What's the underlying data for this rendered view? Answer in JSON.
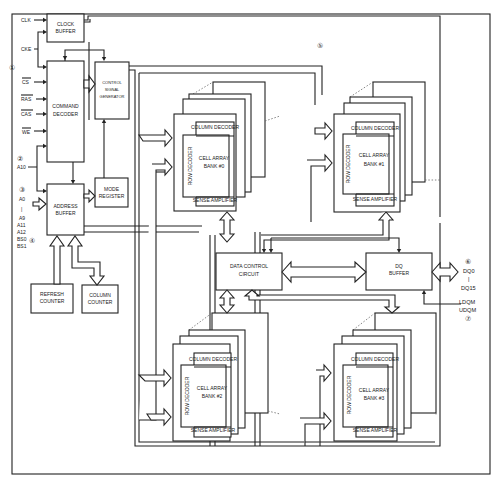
{
  "diagram": {
    "type": "block-diagram",
    "inputs": {
      "clk": "CLK",
      "cke": "CKE",
      "cs": "CS",
      "ras": "RAS",
      "cas": "CAS",
      "we": "WE",
      "a10": "A10",
      "a0": "A0",
      "sep": "|",
      "a9": "A9",
      "a11": "A11",
      "a12": "A12",
      "bs0": "BS0",
      "bs1": "BS1"
    },
    "callouts": {
      "c1": "①",
      "c2": "②",
      "c3": "③",
      "c4": "④",
      "c5": "⑤",
      "c6": "⑥",
      "c7": "⑦"
    },
    "blocks": {
      "clock_buffer": [
        "CLOCK",
        "BUFFER"
      ],
      "command_decoder": [
        "COMMAND",
        "DECODER"
      ],
      "control_signal_generator": [
        "CONTROL",
        "SIGNAL",
        "GENERATOR"
      ],
      "mode_register": [
        "MODE",
        "REGISTER"
      ],
      "address_buffer": [
        "ADDRESS",
        "BUFFER"
      ],
      "refresh_counter": [
        "REFRESH",
        "COUNTER"
      ],
      "column_counter": [
        "COLUMN",
        "COUNTER"
      ],
      "data_control_circuit": [
        "DATA CONTROL",
        "CIRCUIT"
      ],
      "dq_buffer": [
        "DQ",
        "BUFFER"
      ]
    },
    "banks": [
      {
        "column_decoder": "COLUMN DECODER",
        "row_decoder": "ROW DECODER",
        "cell_array": "CELL ARRAY",
        "bank": "BANK #0",
        "sense_amplifier": "SENSE AMPLIFIER"
      },
      {
        "column_decoder": "COLUMN DECODER",
        "row_decoder": "ROW DECODER",
        "cell_array": "CELL ARRAY",
        "bank": "BANK #1",
        "sense_amplifier": "SENSE AMPLIFIER"
      },
      {
        "column_decoder": "COLUMN DECODER",
        "row_decoder": "ROW DECODER",
        "cell_array": "CELL ARRAY",
        "bank": "BANK #2",
        "sense_amplifier": "SENSE AMPLIFIER"
      },
      {
        "column_decoder": "COLUMN DECODER",
        "row_decoder": "ROW DECODER",
        "cell_array": "CELL ARRAY",
        "bank": "BANK #3",
        "sense_amplifier": "SENSE AMPLIFIER"
      }
    ],
    "outputs": {
      "dq0": "DQ0",
      "sep": "|",
      "dq15": "DQ15",
      "ldqm": "LDQM",
      "udqm": "UDQM"
    }
  }
}
